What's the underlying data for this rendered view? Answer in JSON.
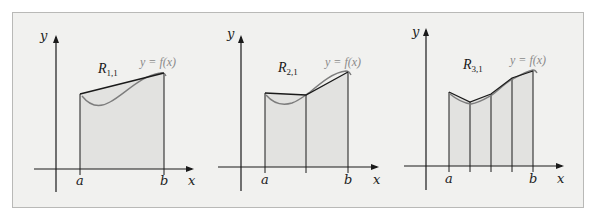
{
  "figure": {
    "colors": {
      "frame_bg": "#f1f1ef",
      "frame_border": "#b9b9b7",
      "fill": "#e2e2e0",
      "curve": "#7d7d7d",
      "axis": "#1a1a1a",
      "function_label": "#8a8a8a"
    },
    "panels": [
      {
        "id": "panel-1",
        "region_label_main": "R",
        "region_label_sub": "1,1",
        "function_label": "y = f(x)",
        "y_axis_label": "y",
        "x_axis_label": "x",
        "left_tick": "a",
        "right_tick": "b",
        "subintervals": 1
      },
      {
        "id": "panel-2",
        "region_label_main": "R",
        "region_label_sub": "2,1",
        "function_label": "y = f(x)",
        "y_axis_label": "y",
        "x_axis_label": "x",
        "left_tick": "a",
        "right_tick": "b",
        "subintervals": 2
      },
      {
        "id": "panel-3",
        "region_label_main": "R",
        "region_label_sub": "3,1",
        "function_label": "y = f(x)",
        "y_axis_label": "y",
        "x_axis_label": "x",
        "left_tick": "a",
        "right_tick": "b",
        "subintervals": 4
      }
    ]
  }
}
